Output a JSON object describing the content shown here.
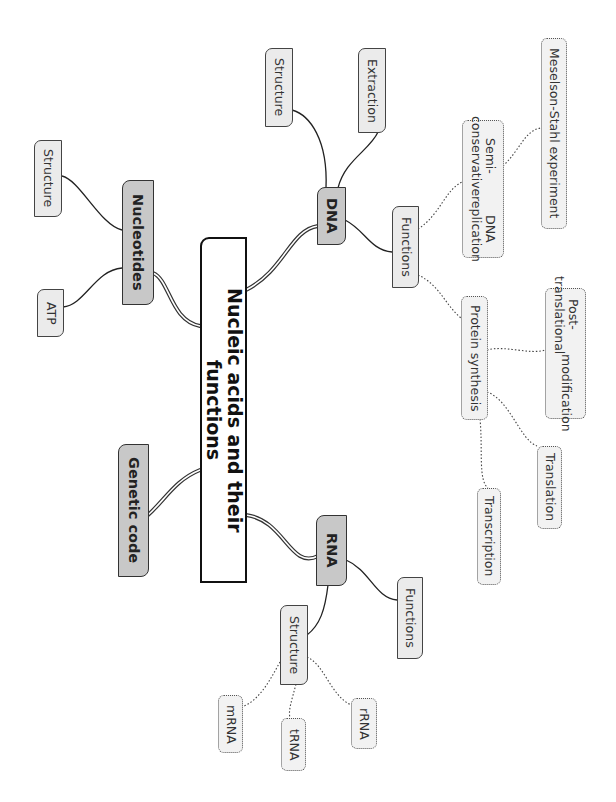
{
  "mindmap": {
    "orientation": "rotated-90-clockwise",
    "central": {
      "label": "Nucleic acids and their functions"
    },
    "branches": {
      "dna": {
        "label": "DNA",
        "children": {
          "structure": {
            "label": "Structure"
          },
          "extraction": {
            "label": "Extraction"
          },
          "functions": {
            "label": "Functions",
            "children": {
              "replication": {
                "label_line1": "Semi-conservative",
                "label_line2": "DNA replication",
                "children": {
                  "meselson": {
                    "label": "Meselson-Stahl experiment"
                  }
                }
              },
              "protein_synthesis": {
                "label": "Protein synthesis",
                "children": {
                  "post_translational": {
                    "label_line1": "Post-translational",
                    "label_line2": "modification"
                  },
                  "translation": {
                    "label": "Translation"
                  },
                  "transcription": {
                    "label": "Transcription"
                  }
                }
              }
            }
          }
        }
      },
      "nucleotides": {
        "label": "Nucleotides",
        "children": {
          "structure": {
            "label": "Structure"
          },
          "atp": {
            "label": "ATP"
          }
        }
      },
      "genetic_code": {
        "label": "Genetic code"
      },
      "rna": {
        "label": "RNA",
        "children": {
          "functions": {
            "label": "Functions"
          },
          "structure": {
            "label": "Structure",
            "children": {
              "mrna": {
                "label": "mRNA"
              },
              "trna": {
                "label": "tRNA"
              },
              "rrna": {
                "label": "rRNA"
              }
            }
          }
        }
      }
    }
  }
}
